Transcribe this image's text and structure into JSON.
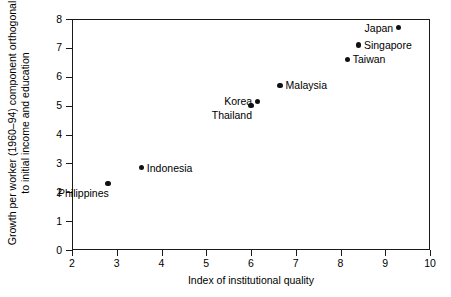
{
  "chart_data": {
    "type": "scatter",
    "title": "",
    "xlabel": "Index of institutional quality",
    "ylabel": "Growth per worker (1960–94) component orthogonal to initial income and education",
    "xlim": [
      2,
      10
    ],
    "ylim": [
      0,
      8
    ],
    "xticks": [
      "2",
      "3",
      "4",
      "5",
      "6",
      "7",
      "8",
      "9",
      "10"
    ],
    "yticks": [
      "0",
      "1",
      "2",
      "3",
      "4",
      "5",
      "6",
      "7",
      "8"
    ],
    "grid": false,
    "legend": "none",
    "marker_color": "#111111",
    "axis_color": "#1a1a1a",
    "points": [
      {
        "label": "Japan",
        "x": 9.3,
        "y": 7.7,
        "label_pos": "left"
      },
      {
        "label": "Singapore",
        "x": 8.4,
        "y": 7.1,
        "label_pos": "right"
      },
      {
        "label": "Taiwan",
        "x": 8.15,
        "y": 6.6,
        "label_pos": "right"
      },
      {
        "label": "Malaysia",
        "x": 6.65,
        "y": 5.7,
        "label_pos": "right"
      },
      {
        "label": "Korea",
        "x": 6.15,
        "y": 5.15,
        "label_pos": "left"
      },
      {
        "label": "Thailand",
        "x": 6.0,
        "y": 5.0,
        "label_pos": "below"
      },
      {
        "label": "Indonesia",
        "x": 3.55,
        "y": 2.85,
        "label_pos": "right"
      },
      {
        "label": "Philippines",
        "x": 2.8,
        "y": 2.3,
        "label_pos": "below"
      }
    ]
  }
}
